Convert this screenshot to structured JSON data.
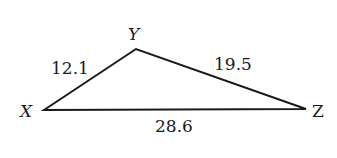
{
  "diagram": {
    "type": "triangle",
    "vertices": {
      "X": {
        "label": "X"
      },
      "Y": {
        "label": "Y"
      },
      "Z": {
        "label": "Z"
      }
    },
    "sides": {
      "XY": {
        "label": "12.1"
      },
      "YZ": {
        "label": "19.5"
      },
      "XZ": {
        "label": "28.6"
      }
    },
    "stroke_color": "#1a1a1a"
  }
}
